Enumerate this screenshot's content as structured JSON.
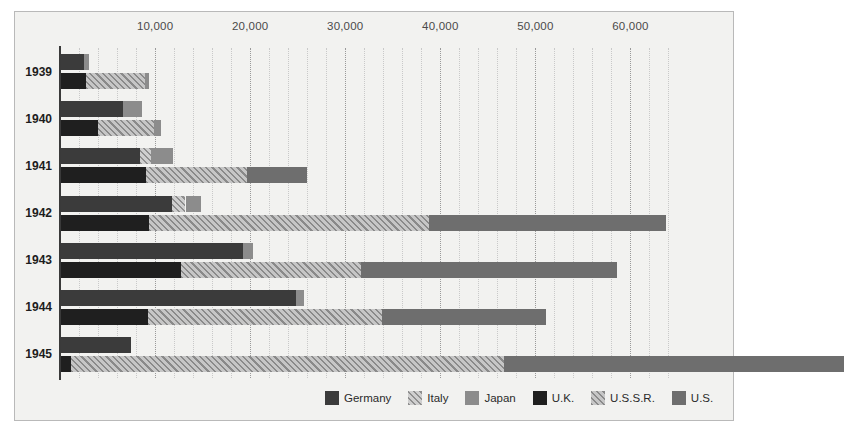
{
  "chart_data": {
    "type": "bar",
    "orientation": "horizontal",
    "stacked": true,
    "title": "",
    "subtitle": "",
    "xlabel": "",
    "ylabel": "",
    "xlim": [
      0,
      65000
    ],
    "ylim": null,
    "grid": true,
    "grid_major_step": 10000,
    "grid_minor_step": 2000,
    "legend_position": "bottom-right",
    "categories": [
      "1939",
      "1940",
      "1941",
      "1942",
      "1943",
      "1944",
      "1945"
    ],
    "group_labels": [
      "Axis",
      "Allies"
    ],
    "xticks": [
      {
        "value": 10000,
        "label": "10,000"
      },
      {
        "value": 20000,
        "label": "20,000"
      },
      {
        "value": 30000,
        "label": "30,000"
      },
      {
        "value": 40000,
        "label": "40,000"
      },
      {
        "value": 50000,
        "label": "50,000"
      },
      {
        "value": 60000,
        "label": "60,000"
      }
    ],
    "series": [
      {
        "name": "Germany",
        "color": "#3b3b3b",
        "fill": "solid",
        "group": "Axis",
        "values": [
          2500,
          6600,
          8400,
          11800,
          19300,
          24800,
          7500
        ]
      },
      {
        "name": "Italy",
        "color": "#c9c9c9",
        "fill": "hatched",
        "group": "Axis",
        "values": [
          0,
          0,
          1200,
          1400,
          0,
          0,
          0
        ]
      },
      {
        "name": "Japan",
        "color": "#8c8c8c",
        "fill": "solid",
        "group": "Axis",
        "values": [
          600,
          2000,
          2300,
          1600,
          1000,
          900,
          0
        ]
      },
      {
        "name": "U.K.",
        "color": "#1f1f1f",
        "fill": "solid",
        "group": "Allies",
        "values": [
          2700,
          4000,
          9000,
          9400,
          12700,
          9300,
          1200
        ]
      },
      {
        "name": "U.S.S.R.",
        "color": "#bdbdbd",
        "fill": "hatched",
        "group": "Allies",
        "values": [
          6200,
          5900,
          10700,
          29400,
          19000,
          24600,
          45500
        ]
      },
      {
        "name": "U.S.",
        "color": "#6e6e6e",
        "fill": "solid",
        "group": "Allies",
        "values": [
          0,
          0,
          6300,
          24900,
          26900,
          17200,
          35800
        ]
      }
    ],
    "bars": [
      {
        "year": "1939",
        "axis": [
          {
            "series": "Germany",
            "value": 2500
          },
          {
            "series": "Japan",
            "value": 600
          }
        ],
        "allies": [
          {
            "series": "U.K.",
            "value": 2700
          },
          {
            "series": "U.S.S.R.",
            "value": 6200
          },
          {
            "series": "Japan",
            "value": 500
          }
        ]
      },
      {
        "year": "1940",
        "axis": [
          {
            "series": "Germany",
            "value": 6600
          },
          {
            "series": "Japan",
            "value": 2000
          }
        ],
        "allies": [
          {
            "series": "U.K.",
            "value": 4000
          },
          {
            "series": "U.S.S.R.",
            "value": 5900
          },
          {
            "series": "Japan",
            "value": 700
          }
        ]
      },
      {
        "year": "1941",
        "axis": [
          {
            "series": "Germany",
            "value": 8400
          },
          {
            "series": "Italy",
            "value": 1200
          },
          {
            "series": "Japan",
            "value": 2300
          }
        ],
        "allies": [
          {
            "series": "U.K.",
            "value": 9000
          },
          {
            "series": "U.S.S.R.",
            "value": 10700
          },
          {
            "series": "U.S.",
            "value": 6300
          }
        ]
      },
      {
        "year": "1942",
        "axis": [
          {
            "series": "Germany",
            "value": 11800
          },
          {
            "series": "Italy",
            "value": 1400
          },
          {
            "series": "Japan",
            "value": 1600
          }
        ],
        "allies": [
          {
            "series": "U.K.",
            "value": 9400
          },
          {
            "series": "U.S.S.R.",
            "value": 29400
          },
          {
            "series": "U.S.",
            "value": 24900
          }
        ]
      },
      {
        "year": "1943",
        "axis": [
          {
            "series": "Germany",
            "value": 19300
          },
          {
            "series": "Japan",
            "value": 1000
          }
        ],
        "allies": [
          {
            "series": "U.K.",
            "value": 12700
          },
          {
            "series": "U.S.S.R.",
            "value": 19000
          },
          {
            "series": "U.S.",
            "value": 26900
          }
        ]
      },
      {
        "year": "1944",
        "axis": [
          {
            "series": "Germany",
            "value": 24800
          },
          {
            "series": "Japan",
            "value": 900
          }
        ],
        "allies": [
          {
            "series": "U.K.",
            "value": 9300
          },
          {
            "series": "U.S.S.R.",
            "value": 24600
          },
          {
            "series": "U.S.",
            "value": 17200
          }
        ]
      },
      {
        "year": "1945",
        "axis": [
          {
            "series": "Germany",
            "value": 7500
          }
        ],
        "allies": [
          {
            "series": "U.K.",
            "value": 1200
          },
          {
            "series": "U.S.S.R.",
            "value": 45500
          },
          {
            "series": "U.S.",
            "value": 35800
          }
        ]
      }
    ]
  },
  "legend": {
    "items": [
      {
        "label": "Germany",
        "color": "#3b3b3b",
        "fill": "solid",
        "key": "germany"
      },
      {
        "label": "Italy",
        "color": "#c9c9c9",
        "fill": "hatched",
        "key": "italy"
      },
      {
        "label": "Japan",
        "color": "#8c8c8c",
        "fill": "solid",
        "key": "japan"
      },
      {
        "label": "U.K.",
        "color": "#1f1f1f",
        "fill": "solid",
        "key": "uk"
      },
      {
        "label": "U.S.S.R.",
        "color": "#bdbdbd",
        "fill": "hatched",
        "key": "ussr"
      },
      {
        "label": "U.S.",
        "color": "#6e6e6e",
        "fill": "solid",
        "key": "us"
      }
    ]
  },
  "colors": {
    "background": "#ffffff",
    "plot_background": "#f2f2f0",
    "frame": "#b9b9b9",
    "axis": "#3a3a3a",
    "gridline_major": "#9a9a9a",
    "gridline_minor": "#c9c9c9",
    "tick_text": "#4a4a4a",
    "year_text": "#1d1d1d"
  }
}
